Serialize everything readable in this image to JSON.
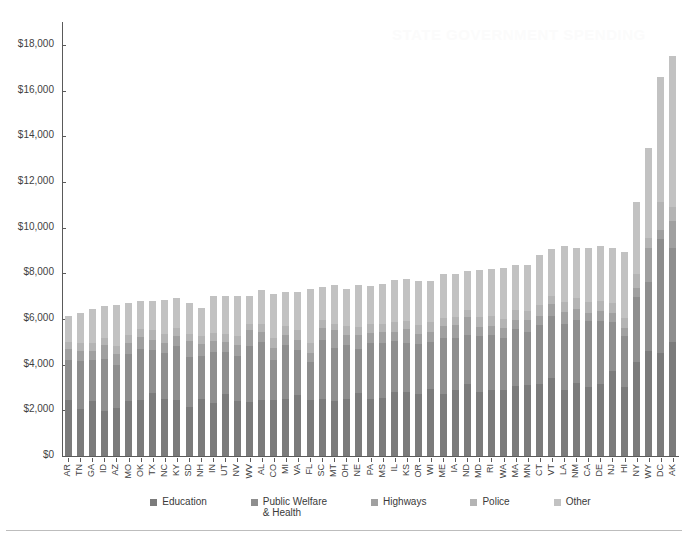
{
  "chart_data": {
    "type": "bar",
    "subtype": "stacked-bar",
    "title": "",
    "xlabel": "",
    "ylabel": "",
    "ylim": [
      0,
      19000
    ],
    "yticks": [
      0,
      2000,
      4000,
      6000,
      8000,
      10000,
      12000,
      14000,
      16000,
      18000
    ],
    "ytick_labels": [
      "$0",
      "$2,000",
      "$4,000",
      "$6,000",
      "$8,000",
      "$10,000",
      "$12,000",
      "$14,000",
      "$16,000",
      "$18,000"
    ],
    "grid": false,
    "legend_position": "bottom",
    "categories": [
      "AR",
      "TN",
      "GA",
      "ID",
      "AZ",
      "MO",
      "OK",
      "TX",
      "NC",
      "KY",
      "SD",
      "NH",
      "IN",
      "UT",
      "NV",
      "WV",
      "AL",
      "CO",
      "MI",
      "VA",
      "FL",
      "SC",
      "MT",
      "OH",
      "NE",
      "PA",
      "MS",
      "IL",
      "KS",
      "OR",
      "WI",
      "ME",
      "IA",
      "ND",
      "MD",
      "RI",
      "WA",
      "MA",
      "MN",
      "CT",
      "VT",
      "LA",
      "NM",
      "CA",
      "DE",
      "NJ",
      "HI",
      "NY",
      "WY",
      "DC",
      "AK"
    ],
    "series": [
      {
        "name": "Education",
        "color": "#7b7b7b",
        "values": [
          2450,
          2050,
          2400,
          1950,
          2100,
          2400,
          2450,
          2750,
          2500,
          2450,
          2150,
          2500,
          2300,
          2700,
          2400,
          2350,
          2450,
          2450,
          2500,
          2650,
          2450,
          2500,
          2400,
          2500,
          2750,
          2500,
          2550,
          2800,
          2800,
          2700,
          2950,
          2700,
          2900,
          3150,
          2800,
          2900,
          2900,
          3050,
          3100,
          3150,
          3400,
          2900,
          3200,
          3000,
          3150,
          3700,
          3000,
          4100,
          4600,
          4500,
          5000
        ]
      },
      {
        "name": "Public Welfare & Health",
        "color": "#8e8e8e",
        "values": [
          1750,
          2100,
          1800,
          2300,
          1900,
          2050,
          2250,
          1900,
          2000,
          2350,
          2200,
          1900,
          2250,
          1850,
          2000,
          2450,
          2550,
          1750,
          2350,
          2000,
          1650,
          2600,
          2350,
          2350,
          1950,
          2450,
          2400,
          2250,
          2150,
          2200,
          2050,
          2450,
          2250,
          2150,
          2450,
          2400,
          2250,
          2500,
          2350,
          2600,
          2750,
          2900,
          2750,
          2900,
          2750,
          2150,
          2250,
          2850,
          3000,
          5000,
          4100
        ]
      },
      {
        "name": "Highways",
        "color": "#a0a0a0",
        "values": [
          500,
          450,
          400,
          600,
          450,
          500,
          500,
          450,
          450,
          450,
          700,
          500,
          500,
          450,
          450,
          700,
          450,
          550,
          450,
          450,
          400,
          500,
          750,
          450,
          600,
          450,
          500,
          400,
          600,
          450,
          450,
          550,
          600,
          800,
          400,
          400,
          450,
          400,
          500,
          400,
          500,
          500,
          500,
          350,
          450,
          400,
          350,
          400,
          1500,
          400,
          1200
        ]
      },
      {
        "name": "Police",
        "color": "#b4b4b4",
        "values": [
          300,
          350,
          350,
          300,
          350,
          350,
          350,
          400,
          400,
          350,
          300,
          350,
          350,
          350,
          400,
          300,
          350,
          400,
          400,
          400,
          450,
          350,
          300,
          400,
          350,
          400,
          350,
          400,
          350,
          400,
          400,
          350,
          350,
          300,
          450,
          450,
          400,
          450,
          400,
          450,
          350,
          450,
          450,
          500,
          450,
          450,
          450,
          600,
          450,
          1200,
          600
        ]
      },
      {
        "name": "Other",
        "color": "#c2c2c2",
        "values": [
          1150,
          1300,
          1500,
          1400,
          1800,
          1400,
          1250,
          1300,
          1500,
          1300,
          1350,
          1250,
          1600,
          1650,
          1750,
          1200,
          1450,
          1950,
          1500,
          1700,
          2350,
          1450,
          1700,
          1600,
          1850,
          1650,
          1750,
          1850,
          1850,
          1900,
          1800,
          1900,
          1850,
          1700,
          2050,
          2050,
          2250,
          1950,
          2000,
          2200,
          2050,
          2450,
          2200,
          2350,
          2400,
          2400,
          2900,
          3150,
          3950,
          5500,
          6600
        ]
      }
    ],
    "totals": [
      6150,
      6250,
      6450,
      6550,
      6600,
      6700,
      6800,
      6800,
      6850,
      6900,
      6700,
      6500,
      7000,
      7000,
      7000,
      7000,
      7250,
      7100,
      7200,
      7200,
      7300,
      7400,
      7500,
      7300,
      7500,
      7450,
      7550,
      7700,
      7750,
      7650,
      7650,
      7950,
      7950,
      8100,
      8150,
      8200,
      8250,
      8350,
      8350,
      8800,
      9050,
      9200,
      9100,
      9100,
      9200,
      9100,
      8950,
      11100,
      13500,
      16600,
      17500
    ]
  },
  "legend": {
    "items": [
      {
        "label": "Education",
        "color": "#7b7b7b"
      },
      {
        "label": "Public Welfare\n& Health",
        "color": "#8e8e8e"
      },
      {
        "label": "Highways",
        "color": "#a0a0a0"
      },
      {
        "label": "Police",
        "color": "#b4b4b4"
      },
      {
        "label": "Other",
        "color": "#c2c2c2"
      }
    ]
  },
  "watermark": {
    "text": "STATE GOVERNMENT SPENDING"
  }
}
